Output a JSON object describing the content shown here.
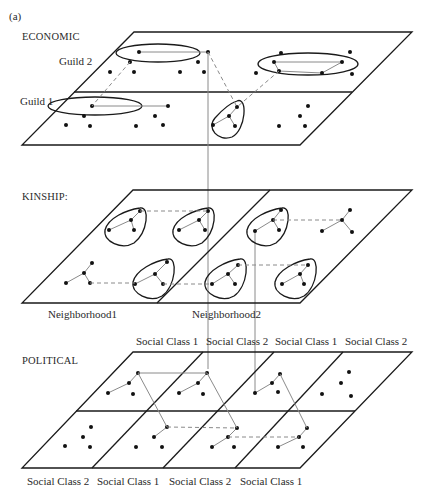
{
  "figure": {
    "panel_label": "(a)",
    "layers": [
      {
        "name": "ECONOMIC",
        "rows": [
          "Guild 2",
          "Guild 1"
        ]
      },
      {
        "name": "KINSHIP:",
        "columns": [
          "Neighborhood1",
          "Neighborhood2"
        ]
      },
      {
        "name": "POLITICAL",
        "top_columns": [
          "Social Class 1",
          "Social Class 2",
          "Social Class 1",
          "Social Class 2"
        ],
        "bottom_columns": [
          "Social Class 2",
          "Social Class 1",
          "Social Class 2",
          "Social Class 1"
        ]
      }
    ],
    "legend": {
      "solid_gray_line": "within-group tie",
      "dashed_gray_line": "between-group tie",
      "vertical_gray_line": "cross-layer link",
      "outline": "group boundary"
    },
    "colors": {
      "plane_edge": "#1a1a1a",
      "tie": "#8a8a8a",
      "node": "#111111",
      "background": "#ffffff"
    }
  }
}
